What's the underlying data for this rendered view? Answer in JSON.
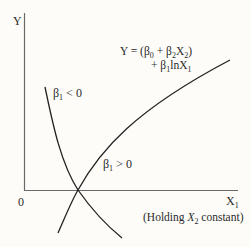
{
  "axes": {
    "y_label": "Y",
    "x_label": "X",
    "x_label_sub": "1",
    "origin_label": "0"
  },
  "equation": {
    "line1_prefix": "Y = (β",
    "line1_sub0": "0",
    "line1_mid": " + β",
    "line1_sub2": "2",
    "line1_x": "X",
    "line1_sub2b": "2",
    "line1_close": ")",
    "line2_prefix": "+ β",
    "line2_sub1": "1",
    "line2_mid": "lnX",
    "line2_sub1b": "1"
  },
  "curves": [
    {
      "name": "beta1-negative",
      "label_prefix": "β",
      "label_sub": "1",
      "label_suffix": " < 0"
    },
    {
      "name": "beta1-positive",
      "label_prefix": "β",
      "label_sub": "1",
      "label_suffix": " > 0"
    }
  ],
  "note": {
    "prefix": "(Holding ",
    "var": "X",
    "sub": "2",
    "suffix": " constant)"
  },
  "colors": {
    "axis": "#6a6a6a",
    "curve": "#222222",
    "background": "#fdfcf8"
  }
}
